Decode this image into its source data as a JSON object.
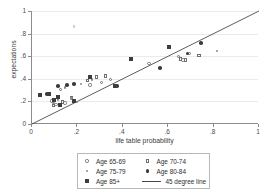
{
  "chart_data": {
    "type": "scatter",
    "title": "",
    "xlabel": "life table probability",
    "ylabel": "expectations",
    "xlim": [
      0,
      1
    ],
    "ylim": [
      0,
      1
    ],
    "xticks": [
      "0",
      ".2",
      ".4",
      ".6",
      ".8",
      "1"
    ],
    "xtick_values": [
      0,
      0.2,
      0.4,
      0.6,
      0.8,
      1
    ],
    "yticks": [
      "0",
      ".2",
      ".4",
      ".6",
      ".8",
      "1"
    ],
    "ytick_values": [
      0,
      0.2,
      0.4,
      0.6,
      0.8,
      1
    ],
    "grid": true,
    "legend_position": "below-plot",
    "reference_line": {
      "label": "45 degree line",
      "from": [
        0,
        0
      ],
      "to": [
        1,
        1
      ],
      "color": "#4a4a4a"
    },
    "series": [
      {
        "name": "Age 65-69",
        "marker": "open-circle",
        "color": "#6f6f6f",
        "points": [
          [
            0.085,
            0.205
          ],
          [
            0.105,
            0.175
          ],
          [
            0.125,
            0.305
          ],
          [
            0.145,
            0.185
          ],
          [
            0.185,
            0.205
          ],
          [
            0.255,
            0.345
          ],
          [
            0.305,
            0.365
          ],
          [
            0.345,
            0.395
          ],
          [
            0.515,
            0.535
          ],
          [
            0.645,
            0.595
          ],
          [
            0.665,
            0.565
          ],
          [
            0.695,
            0.625
          ]
        ]
      },
      {
        "name": "Age 70-74",
        "marker": "open-square",
        "color": "#6f6f6f",
        "points": [
          [
            0.095,
            0.165
          ],
          [
            0.135,
            0.195
          ],
          [
            0.175,
            0.235
          ],
          [
            0.245,
            0.385
          ],
          [
            0.285,
            0.415
          ],
          [
            0.325,
            0.425
          ],
          [
            0.655,
            0.575
          ],
          [
            0.675,
            0.565
          ],
          [
            0.735,
            0.605
          ]
        ]
      },
      {
        "name": "Age 75-79",
        "marker": "dot",
        "color": "#8a8a8a",
        "points": [
          [
            0.095,
            0.185
          ],
          [
            0.115,
            0.215
          ],
          [
            0.145,
            0.325
          ],
          [
            0.175,
            0.225
          ],
          [
            0.195,
            0.195
          ],
          [
            0.215,
            0.355
          ],
          [
            0.265,
            0.395
          ],
          [
            0.815,
            0.645
          ],
          [
            0.185,
            0.865
          ]
        ]
      },
      {
        "name": "Age 80-84",
        "marker": "filled-circle",
        "color": "#3a3a3a",
        "points": [
          [
            0.065,
            0.265
          ],
          [
            0.115,
            0.335
          ],
          [
            0.155,
            0.345
          ],
          [
            0.185,
            0.355
          ],
          [
            0.375,
            0.335
          ],
          [
            0.435,
            0.575
          ],
          [
            0.565,
            0.495
          ],
          [
            0.605,
            0.685
          ],
          [
            0.685,
            0.625
          ],
          [
            0.745,
            0.715
          ]
        ]
      },
      {
        "name": "Age 85+",
        "marker": "filled-square",
        "color": "#3d3d3d",
        "points": [
          [
            0.035,
            0.255
          ],
          [
            0.075,
            0.265
          ],
          [
            0.095,
            0.215
          ],
          [
            0.115,
            0.235
          ],
          [
            0.125,
            0.165
          ],
          [
            0.185,
            0.205
          ],
          [
            0.255,
            0.415
          ],
          [
            0.365,
            0.335
          ],
          [
            0.435,
            0.575
          ],
          [
            0.605,
            0.685
          ]
        ]
      }
    ],
    "outlier_note": "One faint Age 75-79 point plotted high at approximately (0.19, 0.87)"
  },
  "legend": {
    "items": [
      {
        "label": "Age 65-69",
        "marker": "open-circle"
      },
      {
        "label": "Age 70-74",
        "marker": "open-square"
      },
      {
        "label": "Age 75-79",
        "marker": "dot"
      },
      {
        "label": "Age 80-84",
        "marker": "filled-circle"
      },
      {
        "label": "Age 85+",
        "marker": "filled-square"
      },
      {
        "label": "45 degree line",
        "marker": "line"
      }
    ]
  },
  "colors": {
    "axis": "#8c8c8c",
    "grid": "#eceaea",
    "line": "#4a4a4a",
    "background": "#ffffff",
    "page": "#f2f2f2"
  }
}
